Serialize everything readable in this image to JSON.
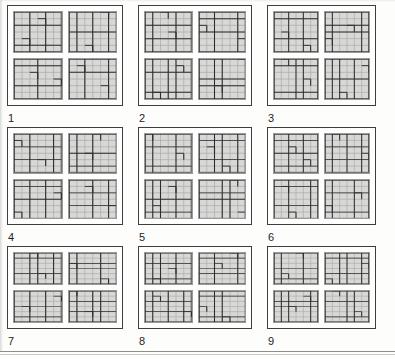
{
  "figure": {
    "panel_count": 9,
    "panels_per_row": 3,
    "subgrids_per_panel": 4,
    "subgrid_rows": 6,
    "subgrid_cols": 6,
    "colors": {
      "panel_border": "#3d3d3d",
      "subgrid_fill": "#d8d8d6",
      "subgrid_border": "#9a9a98",
      "grid_line_light": "#a8a8a6",
      "grid_line_dark": "#2e2e2e",
      "page_background": "#fdfdfc",
      "label_text": "#1d1d1d",
      "page_rule": "#8d8d8b"
    },
    "panels": [
      {
        "label": "1",
        "subgrids": [
          {
            "name": "panel-1-subgrid-a",
            "heavy_v": [
              2,
              4
            ],
            "heavy_h": [
              2,
              5
            ],
            "broken_cells": [
              [
                1,
                3
              ],
              [
                4,
                1
              ]
            ]
          },
          {
            "name": "panel-1-subgrid-b",
            "heavy_v": [
              1,
              3,
              5
            ],
            "heavy_h": [
              3
            ],
            "broken_cells": [
              [
                0,
                4
              ],
              [
                5,
                2
              ]
            ]
          },
          {
            "name": "panel-1-subgrid-c",
            "heavy_v": [
              3
            ],
            "heavy_h": [
              1,
              4
            ],
            "broken_cells": [
              [
                2,
                2
              ],
              [
                3,
                5
              ]
            ]
          },
          {
            "name": "panel-1-subgrid-d",
            "heavy_v": [
              2,
              5
            ],
            "heavy_h": [
              2
            ],
            "broken_cells": [
              [
                1,
                1
              ],
              [
                4,
                4
              ]
            ]
          }
        ]
      },
      {
        "label": "2",
        "subgrids": [
          {
            "name": "panel-2-subgrid-a",
            "heavy_v": [
              1,
              4
            ],
            "heavy_h": [
              2,
              4
            ],
            "broken_cells": [
              [
                0,
                2
              ],
              [
                3,
                3
              ]
            ]
          },
          {
            "name": "panel-2-subgrid-b",
            "heavy_v": [
              2,
              5
            ],
            "heavy_h": [
              1,
              3
            ],
            "broken_cells": [
              [
                2,
                0
              ],
              [
                4,
                5
              ]
            ]
          },
          {
            "name": "panel-2-subgrid-c",
            "heavy_v": [
              1,
              3,
              4
            ],
            "heavy_h": [
              2,
              5
            ],
            "broken_cells": [
              [
                1,
                4
              ],
              [
                5,
                1
              ]
            ]
          },
          {
            "name": "panel-2-subgrid-d",
            "heavy_v": [
              2,
              3
            ],
            "heavy_h": [
              3,
              4
            ],
            "broken_cells": [
              [
                0,
                5
              ],
              [
                4,
                2
              ]
            ]
          }
        ]
      },
      {
        "label": "3",
        "subgrids": [
          {
            "name": "panel-3-subgrid-a",
            "heavy_v": [
              2,
              4
            ],
            "heavy_h": [
              1,
              4
            ],
            "broken_cells": [
              [
                3,
                1
              ],
              [
                5,
                4
              ]
            ]
          },
          {
            "name": "panel-3-subgrid-b",
            "heavy_v": [
              1,
              5
            ],
            "heavy_h": [
              2,
              3
            ],
            "broken_cells": [
              [
                2,
                3
              ],
              [
                4,
                0
              ]
            ]
          },
          {
            "name": "panel-3-subgrid-c",
            "heavy_v": [
              3,
              4
            ],
            "heavy_h": [
              1,
              5
            ],
            "broken_cells": [
              [
                0,
                1
              ],
              [
                3,
                4
              ]
            ]
          },
          {
            "name": "panel-3-subgrid-d",
            "heavy_v": [
              1,
              2,
              4
            ],
            "heavy_h": [
              3
            ],
            "broken_cells": [
              [
                1,
                5
              ],
              [
                5,
                2
              ]
            ]
          }
        ]
      },
      {
        "label": "4",
        "subgrids": [
          {
            "name": "panel-4-subgrid-a",
            "heavy_v": [
              2,
              5
            ],
            "heavy_h": [
              2,
              4
            ],
            "broken_cells": [
              [
                1,
                0
              ],
              [
                4,
                3
              ]
            ]
          },
          {
            "name": "panel-4-subgrid-b",
            "heavy_v": [
              1,
              3
            ],
            "heavy_h": [
              3,
              5
            ],
            "broken_cells": [
              [
                0,
                3
              ],
              [
                3,
                2
              ]
            ]
          },
          {
            "name": "panel-4-subgrid-c",
            "heavy_v": [
              2,
              4
            ],
            "heavy_h": [
              1,
              3
            ],
            "broken_cells": [
              [
                2,
                5
              ],
              [
                5,
                0
              ]
            ]
          },
          {
            "name": "panel-4-subgrid-d",
            "heavy_v": [
              3,
              5
            ],
            "heavy_h": [
              2,
              4
            ],
            "broken_cells": [
              [
                1,
                2
              ],
              [
                4,
                5
              ]
            ]
          }
        ]
      },
      {
        "label": "5",
        "subgrids": [
          {
            "name": "panel-5-subgrid-a",
            "heavy_v": [
              1,
              4
            ],
            "heavy_h": [
              2,
              5
            ],
            "broken_cells": [
              [
                0,
                0
              ],
              [
                3,
                4
              ]
            ]
          },
          {
            "name": "panel-5-subgrid-b",
            "heavy_v": [
              2,
              3,
              5
            ],
            "heavy_h": [
              1,
              4
            ],
            "broken_cells": [
              [
                2,
                1
              ],
              [
                5,
                3
              ]
            ]
          },
          {
            "name": "panel-5-subgrid-c",
            "heavy_v": [
              1,
              2,
              4
            ],
            "heavy_h": [
              3,
              5
            ],
            "broken_cells": [
              [
                1,
                3
              ],
              [
                4,
                1
              ]
            ]
          },
          {
            "name": "panel-5-subgrid-d",
            "heavy_v": [
              3,
              4
            ],
            "heavy_h": [
              2,
              3
            ],
            "broken_cells": [
              [
                0,
                4
              ],
              [
                5,
                5
              ]
            ]
          }
        ]
      },
      {
        "label": "6",
        "subgrids": [
          {
            "name": "panel-6-subgrid-a",
            "heavy_v": [
              2,
              4
            ],
            "heavy_h": [
              1,
              3,
              5
            ],
            "broken_cells": [
              [
                2,
                2
              ],
              [
                4,
                4
              ]
            ]
          },
          {
            "name": "panel-6-subgrid-b",
            "heavy_v": [
              1,
              3,
              5
            ],
            "heavy_h": [
              2,
              4
            ],
            "broken_cells": [
              [
                0,
                1
              ],
              [
                3,
                5
              ]
            ]
          },
          {
            "name": "panel-6-subgrid-c",
            "heavy_v": [
              2,
              5
            ],
            "heavy_h": [
              1,
              4
            ],
            "broken_cells": [
              [
                1,
                1
              ],
              [
                5,
                2
              ]
            ]
          },
          {
            "name": "panel-6-subgrid-d",
            "heavy_v": [
              1,
              4
            ],
            "heavy_h": [
              2,
              5
            ],
            "broken_cells": [
              [
                2,
                4
              ],
              [
                4,
                0
              ]
            ]
          }
        ]
      },
      {
        "label": "7",
        "subgrids": [
          {
            "name": "panel-7-subgrid-a",
            "heavy_v": [
              2,
              3,
              5
            ],
            "heavy_h": [
              1,
              4
            ],
            "broken_cells": [
              [
                0,
                2
              ],
              [
                4,
                3
              ]
            ]
          },
          {
            "name": "panel-7-subgrid-b",
            "heavy_v": [
              1,
              4
            ],
            "heavy_h": [
              2,
              3
            ],
            "broken_cells": [
              [
                2,
                0
              ],
              [
                5,
                4
              ]
            ]
          },
          {
            "name": "panel-7-subgrid-c",
            "heavy_v": [
              2,
              4
            ],
            "heavy_h": [
              3,
              5
            ],
            "broken_cells": [
              [
                1,
                5
              ],
              [
                3,
                1
              ]
            ]
          },
          {
            "name": "panel-7-subgrid-d",
            "heavy_v": [
              1,
              3,
              4
            ],
            "heavy_h": [
              2,
              4
            ],
            "broken_cells": [
              [
                0,
                0
              ],
              [
                4,
                2
              ]
            ]
          }
        ]
      },
      {
        "label": "8",
        "subgrids": [
          {
            "name": "panel-8-subgrid-a",
            "heavy_v": [
              1,
              2,
              4
            ],
            "heavy_h": [
              2,
              5
            ],
            "broken_cells": [
              [
                3,
                3
              ],
              [
                5,
                1
              ]
            ]
          },
          {
            "name": "panel-8-subgrid-b",
            "heavy_v": [
              2,
              5
            ],
            "heavy_h": [
              1,
              3,
              4
            ],
            "broken_cells": [
              [
                0,
                4
              ],
              [
                2,
                2
              ]
            ]
          },
          {
            "name": "panel-8-subgrid-c",
            "heavy_v": [
              1,
              3,
              5
            ],
            "heavy_h": [
              2,
              4
            ],
            "broken_cells": [
              [
                1,
                1
              ],
              [
                4,
                5
              ]
            ]
          },
          {
            "name": "panel-8-subgrid-d",
            "heavy_v": [
              2,
              3
            ],
            "heavy_h": [
              1,
              5
            ],
            "broken_cells": [
              [
                3,
                0
              ],
              [
                5,
                3
              ]
            ]
          }
        ]
      },
      {
        "label": "9",
        "subgrids": [
          {
            "name": "panel-9-subgrid-a",
            "heavy_v": [
              1,
              4
            ],
            "heavy_h": [
              3,
              5
            ],
            "broken_cells": [
              [
                0,
                3
              ],
              [
                4,
                1
              ]
            ]
          },
          {
            "name": "panel-9-subgrid-b",
            "heavy_v": [
              2,
              3,
              5
            ],
            "heavy_h": [
              1,
              4
            ],
            "broken_cells": [
              [
                2,
                5
              ],
              [
                5,
                0
              ]
            ]
          },
          {
            "name": "panel-9-subgrid-c",
            "heavy_v": [
              1,
              2,
              5
            ],
            "heavy_h": [
              2,
              3
            ],
            "broken_cells": [
              [
                1,
                4
              ],
              [
                3,
                2
              ]
            ]
          },
          {
            "name": "panel-9-subgrid-d",
            "heavy_v": [
              3,
              4
            ],
            "heavy_h": [
              2,
              5
            ],
            "broken_cells": [
              [
                0,
                1
              ],
              [
                4,
                4
              ]
            ]
          }
        ]
      }
    ]
  }
}
